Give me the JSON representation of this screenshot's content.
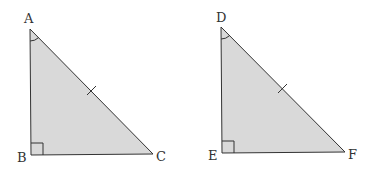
{
  "colors": {
    "fill": "#d9d9d9",
    "stroke": "#333333",
    "background": "#ffffff"
  },
  "triangles": [
    {
      "name": "triangle-abc",
      "vertices": {
        "A": {
          "label": "A",
          "x": 30,
          "y": 29
        },
        "B": {
          "label": "B",
          "x": 31,
          "y": 155
        },
        "C": {
          "label": "C",
          "x": 153,
          "y": 154
        }
      },
      "right_angle_at": "B",
      "angle_arc_at": "A",
      "tick_on_side": "AC"
    },
    {
      "name": "triangle-def",
      "vertices": {
        "D": {
          "label": "D",
          "x": 221,
          "y": 27
        },
        "E": {
          "label": "E",
          "x": 222,
          "y": 153
        },
        "F": {
          "label": "F",
          "x": 345,
          "y": 152
        }
      },
      "right_angle_at": "E",
      "angle_arc_at": "D",
      "tick_on_side": "DF"
    }
  ],
  "labels": {
    "A": "A",
    "B": "B",
    "C": "C",
    "D": "D",
    "E": "E",
    "F": "F"
  }
}
